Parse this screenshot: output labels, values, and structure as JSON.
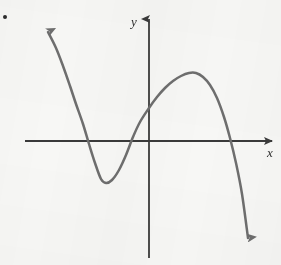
{
  "figure": {
    "name": "cubic-function-graph",
    "background_color": "#f7f7f5",
    "width": 281,
    "height": 265,
    "item_marker": "•"
  },
  "axes": {
    "x_label": "x",
    "y_label": "y",
    "axis_color": "#3a3a3a",
    "x_axis": {
      "y_pixel": 141,
      "x_start": 25,
      "x_end": 277,
      "arrow": "right"
    },
    "y_axis": {
      "x_pixel": 149,
      "y_start": 13,
      "y_end": 258,
      "arrow": "up"
    },
    "origin": {
      "x": 149,
      "y": 141
    },
    "ticks": [],
    "grid": false
  },
  "chart_data": {
    "type": "line",
    "title": "",
    "subtitle": "",
    "xlabel": "x",
    "ylabel": "y",
    "curve_color": "#6e6e6e",
    "stroke_width": 2.5,
    "end_arrows": {
      "left_branch": "up-left",
      "right_branch": "down-right"
    },
    "x_intercepts": [
      -3.1,
      -0.25,
      3.4
    ],
    "y_intercept": 0.7,
    "local_minimum": {
      "x": -2.0,
      "y": -1.7
    },
    "local_maximum": {
      "x": 1.8,
      "y": 2.7
    },
    "axis_units_per_pixel": 0.0385,
    "points_pixels": [
      [
        48,
        32
      ],
      [
        56,
        48
      ],
      [
        63,
        66
      ],
      [
        70,
        86
      ],
      [
        76,
        104
      ],
      [
        83,
        124
      ],
      [
        89,
        144
      ],
      [
        95,
        163
      ],
      [
        101,
        179
      ],
      [
        106,
        183
      ],
      [
        112,
        180
      ],
      [
        119,
        170
      ],
      [
        126,
        155
      ],
      [
        133,
        137
      ],
      [
        140,
        122
      ],
      [
        149,
        108
      ],
      [
        157,
        97
      ],
      [
        165,
        88
      ],
      [
        173,
        81
      ],
      [
        181,
        76
      ],
      [
        189,
        73
      ],
      [
        196,
        73
      ],
      [
        203,
        77
      ],
      [
        210,
        85
      ],
      [
        217,
        98
      ],
      [
        224,
        117
      ],
      [
        230,
        138
      ],
      [
        236,
        163
      ],
      [
        242,
        194
      ],
      [
        248,
        238
      ]
    ],
    "xlim": [
      -4.6,
      5.0
    ],
    "ylim": [
      -4.4,
      3.3
    ],
    "legend": [],
    "legend_position": "none",
    "annotations": []
  }
}
